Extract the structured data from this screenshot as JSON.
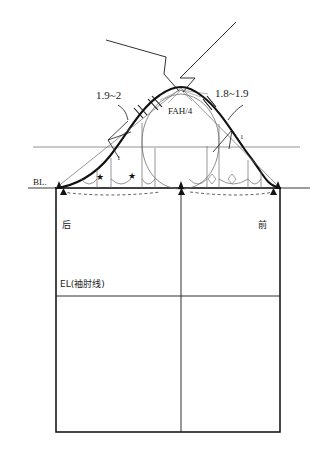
{
  "drawing": {
    "title": "sleeve-cap-draft",
    "labels": {
      "left_cap_measure": "1.9~2",
      "right_cap_measure": "1.8~1.9",
      "center_cap_measure": "FAH/4",
      "left_ease_mark": "1",
      "right_ease_mark": "1",
      "biceps_line": "BL.",
      "elbow_line": "EL(袖肘线)",
      "back_panel": "后",
      "front_panel": "前"
    },
    "markers": {
      "notch": "▲",
      "star": "★",
      "diamond": "◇",
      "tick_double": "double-hash-tick"
    },
    "colors": {
      "ink": "#1a1a1a",
      "thin": "#555555",
      "hairline": "#8a8a8a"
    }
  }
}
